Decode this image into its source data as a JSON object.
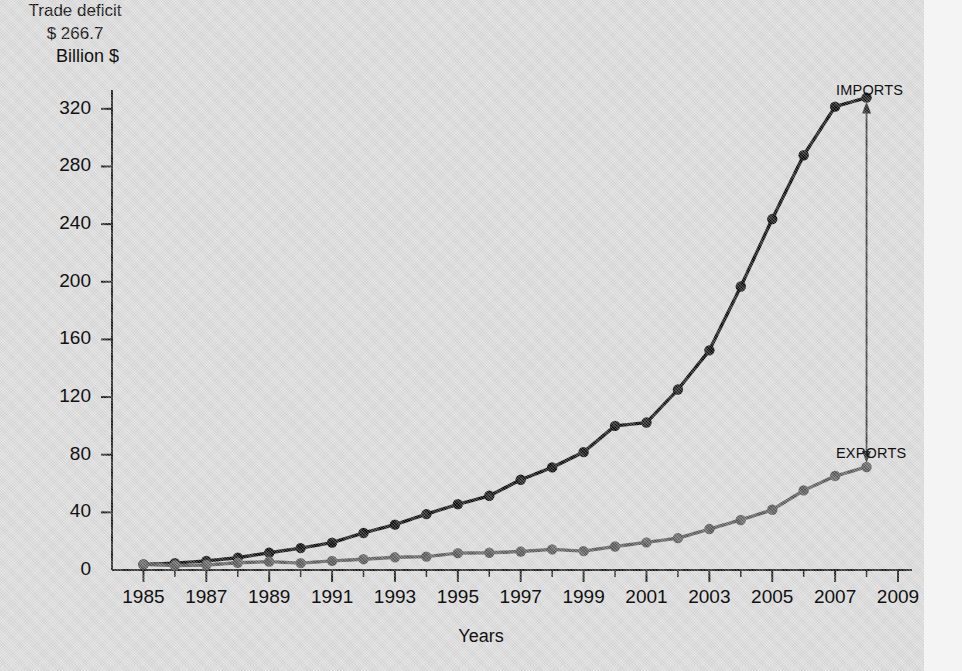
{
  "figure": {
    "background_color": "#d9d9d9",
    "imports_color": "#0d0d0d",
    "exports_color": "#595959",
    "axis_color": "#1a1a1a"
  },
  "annotations": {
    "imports_label": "IMPORTS",
    "exports_label": "EXPORTS",
    "deficit_title": "Trade deficit",
    "deficit_value": "$ 266.7"
  },
  "chart_data": {
    "type": "line",
    "title": "",
    "xlabel": "Years",
    "ylabel": "Billion $",
    "xlim": [
      1984,
      2009
    ],
    "ylim": [
      0,
      340
    ],
    "ytick_labels": [
      "0",
      "40",
      "80",
      "120",
      "160",
      "200",
      "240",
      "280",
      "320"
    ],
    "ytick_values": [
      0,
      40,
      80,
      120,
      160,
      200,
      240,
      280,
      320
    ],
    "xtick_labels": [
      "1985",
      "1987",
      "1989",
      "1991",
      "1993",
      "1995",
      "1997",
      "1999",
      "2001",
      "2003",
      "2005",
      "2007",
      "2009"
    ],
    "xtick_values": [
      1985,
      1987,
      1989,
      1991,
      1993,
      1995,
      1997,
      1999,
      2001,
      2003,
      2005,
      2007,
      2009
    ],
    "grid": false,
    "legend_position": "right-inline",
    "x": [
      1985,
      1986,
      1987,
      1988,
      1989,
      1990,
      1991,
      1992,
      1993,
      1994,
      1995,
      1996,
      1997,
      1998,
      1999,
      2000,
      2001,
      2002,
      2003,
      2004,
      2005,
      2006,
      2007,
      2008
    ],
    "series": [
      {
        "name": "IMPORTS",
        "color": "#0d0d0d",
        "values": [
          3.9,
          4.8,
          6.3,
          8.5,
          12.0,
          15.2,
          19.0,
          25.7,
          31.5,
          38.8,
          45.6,
          51.5,
          62.6,
          71.2,
          81.8,
          100.0,
          102.3,
          125.2,
          152.4,
          196.7,
          243.5,
          287.8,
          321.5,
          327.8
        ]
      },
      {
        "name": "EXPORTS",
        "color": "#595959",
        "values": [
          3.9,
          3.1,
          3.5,
          5.0,
          5.8,
          4.8,
          6.3,
          7.5,
          8.8,
          9.3,
          11.7,
          12.0,
          12.8,
          14.3,
          13.1,
          16.3,
          19.2,
          22.1,
          28.4,
          34.7,
          41.8,
          55.2,
          65.2,
          71.5
        ]
      }
    ],
    "deficit_2008": 266.7
  }
}
